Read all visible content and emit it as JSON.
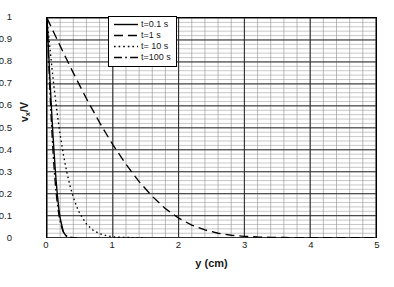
{
  "chart_data": {
    "type": "line",
    "title": "",
    "xlabel": "y (cm)",
    "ylabel": "v_x/V",
    "ylabel_base": "v",
    "ylabel_sub": "x",
    "ylabel_tail": "/V",
    "xlim": [
      0,
      5
    ],
    "ylim": [
      0,
      1
    ],
    "grid": true,
    "grid_major_x": 1,
    "grid_minor_x": 0.2,
    "grid_major_y": 0.1,
    "grid_minor_y": 0.02,
    "legend_position": "top-center-inside",
    "xticks": [
      "0",
      "1",
      "2",
      "3",
      "4",
      "5"
    ],
    "xtick_values": [
      0,
      1,
      2,
      3,
      4,
      5
    ],
    "yticks": [
      "0",
      "0.1",
      "0.2",
      "0.3",
      "0.4",
      "0.5",
      "0.6",
      "0.7",
      "0.8",
      "0.9",
      "1"
    ],
    "ytick_values": [
      0,
      0.1,
      0.2,
      0.3,
      0.4,
      0.5,
      0.6,
      0.7,
      0.8,
      0.9,
      1
    ],
    "series": [
      {
        "name": "t=0.1 s",
        "dash": "solid",
        "color": "#000000",
        "x": [
          0,
          0.01,
          0.02,
          0.03,
          0.04,
          0.05,
          0.06,
          0.07,
          0.08,
          0.09,
          0.1,
          0.11,
          0.12,
          0.13,
          0.14,
          0.15,
          0.16,
          0.18,
          0.2,
          0.25,
          0.3
        ],
        "values": [
          1.0,
          0.936,
          0.873,
          0.811,
          0.75,
          0.691,
          0.633,
          0.578,
          0.524,
          0.473,
          0.424,
          0.378,
          0.334,
          0.293,
          0.255,
          0.22,
          0.188,
          0.132,
          0.089,
          0.025,
          0.004
        ]
      },
      {
        "name": "t=1 s",
        "dash": "dashed",
        "color": "#000000",
        "x": [
          0,
          0.1,
          0.2,
          0.3,
          0.4,
          0.5,
          0.6,
          0.7,
          0.8,
          0.9,
          1.0,
          1.2,
          1.4,
          1.6,
          1.8,
          2.0,
          2.2,
          2.4,
          2.6,
          2.8,
          3.0,
          3.2,
          3.4,
          3.6,
          3.8,
          4.0,
          4.3,
          4.6,
          5.0
        ],
        "values": [
          1.0,
          0.936,
          0.873,
          0.811,
          0.75,
          0.691,
          0.633,
          0.578,
          0.524,
          0.473,
          0.424,
          0.334,
          0.255,
          0.188,
          0.132,
          0.089,
          0.057,
          0.035,
          0.02,
          0.011,
          0.006,
          0.003,
          0.0014,
          0.0006,
          0.0002,
          0.0001,
          0.0,
          0.0,
          0.0
        ]
      },
      {
        "name": "t= 10 s",
        "dash": "dotted",
        "color": "#000000",
        "x": [
          0,
          0.03,
          0.06,
          0.1,
          0.15,
          0.2,
          0.25,
          0.3,
          0.35,
          0.4,
          0.45,
          0.5,
          0.6,
          0.7,
          0.8,
          0.9,
          1.0,
          1.1,
          1.2,
          1.3,
          1.4,
          1.5
        ],
        "values": [
          1.0,
          0.907,
          0.817,
          0.703,
          0.577,
          0.468,
          0.376,
          0.299,
          0.236,
          0.184,
          0.142,
          0.109,
          0.062,
          0.034,
          0.018,
          0.009,
          0.004,
          0.002,
          0.001,
          0.0004,
          0.0001,
          0.0
        ]
      },
      {
        "name": "t=100 s",
        "dash": "dashdot",
        "color": "#000000",
        "x": [
          0,
          0.01,
          0.02,
          0.03,
          0.05,
          0.07,
          0.09,
          0.11,
          0.13,
          0.15,
          0.18,
          0.21,
          0.24,
          0.27,
          0.3,
          0.35,
          0.4,
          0.45
        ],
        "values": [
          1.0,
          0.922,
          0.846,
          0.772,
          0.632,
          0.508,
          0.399,
          0.308,
          0.233,
          0.173,
          0.105,
          0.06,
          0.032,
          0.016,
          0.0075,
          0.002,
          0.0004,
          0.0
        ]
      }
    ]
  },
  "legend": {
    "items": [
      {
        "label": "t=0.1 s",
        "dash": "solid"
      },
      {
        "label": "t=1 s",
        "dash": "dashed"
      },
      {
        "label": "t= 10 s",
        "dash": "dotted"
      },
      {
        "label": "t=100 s",
        "dash": "dashdot"
      }
    ]
  }
}
